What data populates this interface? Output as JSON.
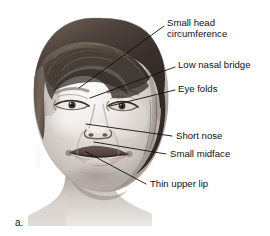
{
  "figure": {
    "caption": "a.",
    "artist_signature": "Hagen",
    "background_color": "#ffffff",
    "ink_color": "#111111"
  },
  "annotations": [
    {
      "id": "small-head-circumference",
      "text_line1": "Small head",
      "text_line2": "circumference",
      "label_x": 167,
      "label_y": 18,
      "leader": {
        "x1": 164,
        "y1": 26,
        "x2": 79,
        "y2": 88
      }
    },
    {
      "id": "low-nasal-bridge",
      "text_line1": "Low nasal bridge",
      "text_line2": "",
      "label_x": 178,
      "label_y": 60,
      "leader": {
        "x1": 175,
        "y1": 67,
        "x2": 90,
        "y2": 98
      }
    },
    {
      "id": "eye-folds",
      "text_line1": "Eye folds",
      "text_line2": "",
      "label_x": 178,
      "label_y": 84,
      "leader": {
        "x1": 175,
        "y1": 90,
        "x2": 110,
        "y2": 106
      }
    },
    {
      "id": "short-nose",
      "text_line1": "Short nose",
      "text_line2": "",
      "label_x": 176,
      "label_y": 131,
      "leader": {
        "x1": 172,
        "y1": 136,
        "x2": 86,
        "y2": 124
      }
    },
    {
      "id": "small-midface",
      "text_line1": "Small midface",
      "text_line2": "",
      "label_x": 170,
      "label_y": 149,
      "leader": {
        "x1": 166,
        "y1": 154,
        "x2": 94,
        "y2": 142
      }
    },
    {
      "id": "thin-upper-lip",
      "text_line1": "Thin upper lip",
      "text_line2": "",
      "label_x": 150,
      "label_y": 179,
      "leader": {
        "x1": 146,
        "y1": 184,
        "x2": 86,
        "y2": 152
      }
    }
  ]
}
